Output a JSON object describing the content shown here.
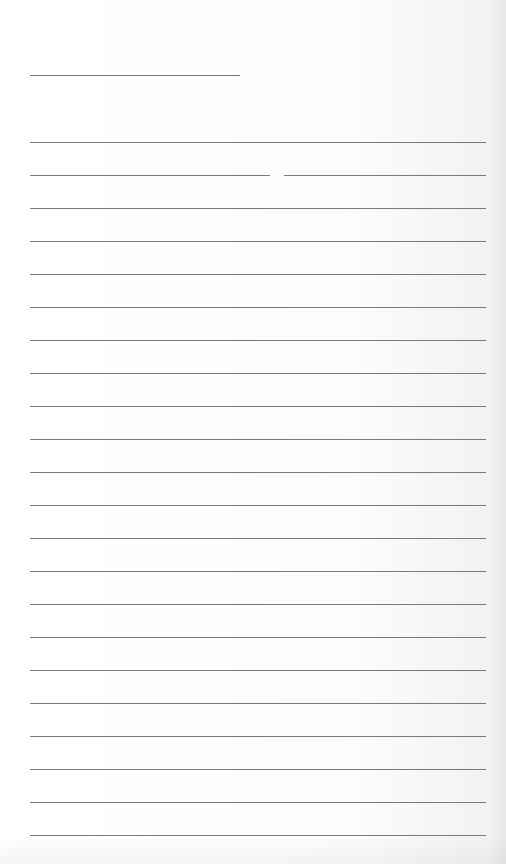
{
  "page": {
    "type": "lined-paper",
    "title_line": {
      "text": ""
    },
    "lines_count": 22,
    "line_color": "#7a7a7a",
    "background_color": "#ffffff"
  }
}
